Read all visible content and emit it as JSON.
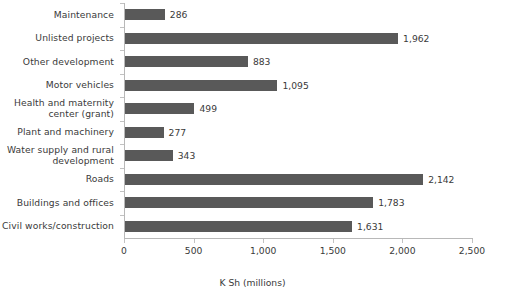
{
  "chart_data": {
    "type": "bar",
    "orientation": "horizontal",
    "title": "",
    "xlabel": "K Sh (millions)",
    "ylabel": "",
    "xlim": [
      0,
      2500
    ],
    "xticks": [
      0,
      500,
      1000,
      1500,
      2000,
      2500
    ],
    "xtick_labels": [
      "0",
      "500",
      "1,000",
      "1,500",
      "2,000",
      "2,500"
    ],
    "grid": false,
    "legend": null,
    "bar_color": "#595959",
    "categories": [
      "Maintenance",
      "Unlisted projects",
      "Other development",
      "Motor vehicles",
      "Health and maternity\ncenter (grant)",
      "Plant and machinery",
      "Water supply and rural\ndevelopment",
      "Roads",
      "Buildings and offices",
      "Civil works/construction"
    ],
    "values": [
      286,
      1962,
      883,
      1095,
      499,
      277,
      343,
      2142,
      1783,
      1631
    ],
    "value_labels": [
      "286",
      "1,962",
      "883",
      "1,095",
      "499",
      "277",
      "343",
      "2,142",
      "1,783",
      "1,631"
    ]
  }
}
